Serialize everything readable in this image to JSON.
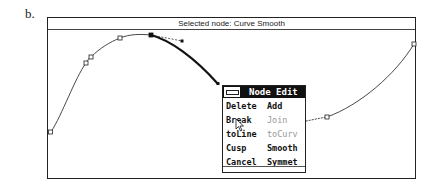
{
  "figure_label": "b.",
  "window": {
    "status_text": "Selected node: Curve   Smooth"
  },
  "menu": {
    "title": "Node Edit",
    "items": [
      {
        "label": "Delete",
        "enabled": true
      },
      {
        "label": "Add",
        "enabled": true
      },
      {
        "label": "Break",
        "enabled": true
      },
      {
        "label": "Join",
        "enabled": false
      },
      {
        "label": "toLine",
        "enabled": true
      },
      {
        "label": "toCurv",
        "enabled": false
      },
      {
        "label": "Cusp",
        "enabled": true
      },
      {
        "label": "Smooth",
        "enabled": true
      },
      {
        "label": "Cancel",
        "enabled": true
      },
      {
        "label": "Symmet",
        "enabled": true
      }
    ]
  },
  "icons": {
    "system_menu": "system-menu-icon",
    "pointer": "mouse-pointer-icon"
  }
}
